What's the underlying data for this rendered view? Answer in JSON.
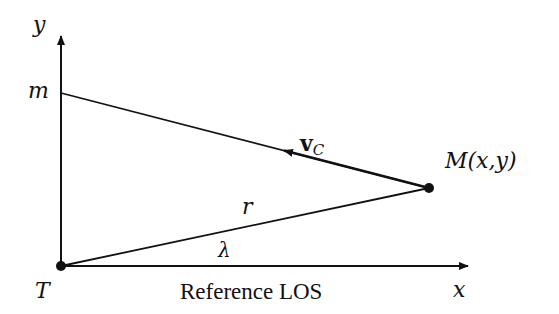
{
  "diagram": {
    "axes": {
      "y_label": "y",
      "x_label": "x",
      "x_axis_caption": "Reference LOS"
    },
    "points": {
      "target": {
        "label": "T"
      },
      "missile": {
        "label": "M(x,y)"
      },
      "intercept": {
        "label": "m"
      }
    },
    "vectors": {
      "velocity": {
        "label_main": "v",
        "label_sub": "C"
      }
    },
    "segments": {
      "range": {
        "label": "r"
      }
    },
    "angles": {
      "los": {
        "label": "λ"
      }
    },
    "colors": {
      "stroke": "#111111",
      "background": "#ffffff"
    }
  }
}
